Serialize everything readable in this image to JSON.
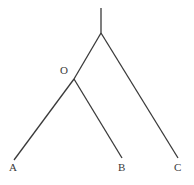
{
  "figure": {
    "kind": "tree-diagram",
    "width": 194,
    "height": 185,
    "background_color": "#ffffff",
    "line_color": "#3a3a3a",
    "line_width": 1.3,
    "label_font_size": 11
  },
  "nodes": [
    {
      "id": "root",
      "name": "root-node",
      "label": "",
      "x": 101,
      "y": 33,
      "label_x": 0,
      "label_y": 0
    },
    {
      "id": "O",
      "name": "node-o",
      "label": "O",
      "x": 74,
      "y": 79,
      "label_x": 60,
      "label_y": 65
    },
    {
      "id": "A",
      "name": "leaf-a",
      "label": "A",
      "x": 14,
      "y": 160,
      "label_x": 9,
      "label_y": 162
    },
    {
      "id": "B",
      "name": "leaf-b",
      "label": "B",
      "x": 122,
      "y": 158,
      "label_x": 118,
      "label_y": 162
    },
    {
      "id": "C",
      "name": "leaf-c",
      "label": "C",
      "x": 178,
      "y": 158,
      "label_x": 174,
      "label_y": 162
    }
  ],
  "edges": [
    {
      "id": "stem",
      "name": "root-stem",
      "x1": 101,
      "y1": 8,
      "x2": 101,
      "y2": 33
    },
    {
      "id": "root-O",
      "name": "edge-root-to-o",
      "x1": 101,
      "y1": 33,
      "x2": 74,
      "y2": 79
    },
    {
      "id": "root-C",
      "name": "edge-root-to-c",
      "x1": 101,
      "y1": 33,
      "x2": 178,
      "y2": 158
    },
    {
      "id": "O-A",
      "name": "edge-o-to-a",
      "x1": 74,
      "y1": 79,
      "x2": 14,
      "y2": 160
    },
    {
      "id": "O-B",
      "name": "edge-o-to-b",
      "x1": 74,
      "y1": 79,
      "x2": 122,
      "y2": 158
    }
  ],
  "labels": {
    "o": "O",
    "a": "A",
    "b": "B",
    "c": "C"
  }
}
